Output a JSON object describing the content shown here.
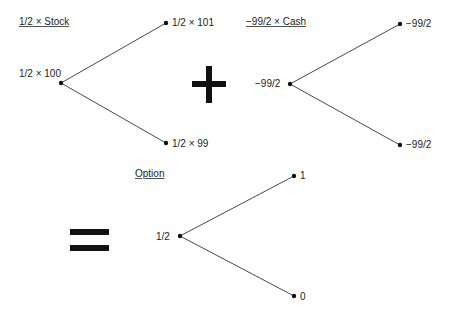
{
  "trees": [
    {
      "title": "1/2 × Stock",
      "root": "1/2 × 100",
      "up": "1/2 × 101",
      "down": "1/2 × 99"
    },
    {
      "title": "−99/2 × Cash",
      "root": "−99/2",
      "up": "−99/2",
      "down": "−99/2"
    },
    {
      "title": "Option",
      "root": "1/2",
      "up": "1",
      "down": "0"
    }
  ],
  "operators": {
    "plus": "plus-sign",
    "equals": "equals-sign"
  },
  "colors": {
    "line": "#333333",
    "node": "#111111",
    "operator": "#111111"
  }
}
